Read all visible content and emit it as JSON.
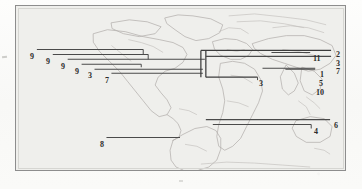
{
  "figure": {
    "kind": "scanned-map-figure",
    "frame_color": "#8d8d8d",
    "plate_background": "#efefec",
    "coastline_color": "#b3b0ad",
    "bar_color": "#4a4a4a",
    "label_color": "#2b2b2b"
  },
  "labels": {
    "left_group": [
      {
        "id": "l1",
        "text": "9",
        "x": 29,
        "y": 52
      },
      {
        "id": "l2",
        "text": "9",
        "x": 45,
        "y": 57
      },
      {
        "id": "l3",
        "text": "9",
        "x": 60,
        "y": 62
      },
      {
        "id": "l4",
        "text": "9",
        "x": 74,
        "y": 67
      },
      {
        "id": "l5",
        "text": "3",
        "x": 87,
        "y": 72
      },
      {
        "id": "l6",
        "text": "7",
        "x": 104,
        "y": 76
      }
    ],
    "center_group": [
      {
        "id": "c1",
        "text": "3",
        "x": 257,
        "y": 78
      }
    ],
    "right_inner_group": [
      {
        "id": "r1",
        "text": "11",
        "x": 313,
        "y": 58
      },
      {
        "id": "r2",
        "text": "1",
        "x": 319,
        "y": 74
      },
      {
        "id": "r3",
        "text": "5",
        "x": 318,
        "y": 82
      },
      {
        "id": "r4",
        "text": "10",
        "x": 315,
        "y": 91
      }
    ],
    "right_outer_group": [
      {
        "id": "o1",
        "text": "2",
        "x": 335,
        "y": 53
      },
      {
        "id": "o2",
        "text": "3",
        "x": 335,
        "y": 61
      },
      {
        "id": "o3",
        "text": "7",
        "x": 335,
        "y": 69
      }
    ],
    "bottom_group": [
      {
        "id": "b1",
        "text": "8",
        "x": 99,
        "y": 143
      },
      {
        "id": "b2",
        "text": "4",
        "x": 314,
        "y": 130
      },
      {
        "id": "b3",
        "text": "6",
        "x": 334,
        "y": 124
      }
    ]
  },
  "bars": {
    "description": "Horizontal range bars drawn across the world map, each terminating at a numbered label.",
    "left_nested": [
      {
        "id": "bar-9a",
        "x1": 36,
        "x2": 143,
        "y": 49,
        "tick_down": 5
      },
      {
        "id": "bar-9b",
        "x1": 52,
        "x2": 148,
        "y": 54,
        "tick_down": 5
      },
      {
        "id": "bar-9c",
        "x1": 67,
        "x2": 205,
        "y": 59
      },
      {
        "id": "bar-9d",
        "x1": 81,
        "x2": 141,
        "y": 64,
        "tick_down": 3
      },
      {
        "id": "bar-3l",
        "x1": 94,
        "x2": 203,
        "y": 69
      },
      {
        "id": "bar-7l",
        "x1": 111,
        "x2": 203,
        "y": 73
      }
    ],
    "center_bracket": [
      {
        "id": "bracket-v-left",
        "x": 201,
        "y1": 50,
        "y2": 77
      },
      {
        "id": "bracket-v-right",
        "x": 206,
        "y1": 50,
        "y2": 77
      },
      {
        "id": "bracket-top",
        "x1": 201,
        "x2": 310,
        "y": 50
      },
      {
        "id": "bracket-bottom",
        "x1": 206,
        "x2": 310,
        "y": 77
      }
    ],
    "center_three": [
      {
        "id": "bar-3c",
        "x1": 206,
        "x2": 258,
        "y": 77
      }
    ],
    "right_group": [
      {
        "id": "bar-11",
        "x1": 272,
        "x2": 311,
        "y": 52
      },
      {
        "id": "bar-2",
        "x1": 206,
        "x2": 332,
        "y": 50
      },
      {
        "id": "bar-1",
        "x1": 286,
        "x2": 316,
        "y": 69
      },
      {
        "id": "bar-37",
        "x1": 206,
        "x2": 332,
        "y": 56
      }
    ],
    "bottom_group": [
      {
        "id": "bar-6",
        "x1": 206,
        "x2": 331,
        "y": 120
      },
      {
        "id": "bar-4",
        "x1": 213,
        "x2": 312,
        "y": 125
      },
      {
        "id": "bar-8",
        "x1": 106,
        "x2": 180,
        "y": 138
      }
    ]
  }
}
